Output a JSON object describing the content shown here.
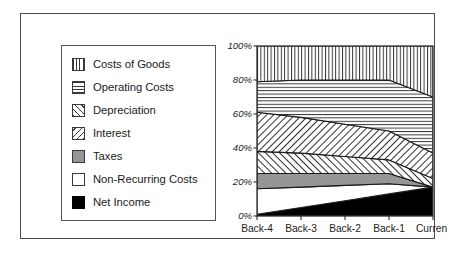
{
  "legend": {
    "items": [
      {
        "label": "Costs of Goods",
        "swatch": "vertical-lines-swatch",
        "color": "#ffffff"
      },
      {
        "label": "Operating Costs",
        "swatch": "horizontal-lines-swatch",
        "color": "#ffffff"
      },
      {
        "label": "Depreciation",
        "swatch": "diagonal-up-hatch-swatch",
        "color": "#ffffff"
      },
      {
        "label": "Interest",
        "swatch": "diagonal-down-hatch-swatch",
        "color": "#ffffff"
      },
      {
        "label": "Taxes",
        "swatch": "solid-gray-swatch",
        "color": "#969696"
      },
      {
        "label": "Non-Recurring Costs",
        "swatch": "solid-white-swatch",
        "color": "#ffffff"
      },
      {
        "label": "Net Income",
        "swatch": "solid-black-swatch",
        "color": "#000000"
      }
    ]
  },
  "axes": {
    "y_ticks": [
      "0%",
      "20%",
      "40%",
      "60%",
      "80%",
      "100%"
    ],
    "x_ticks": [
      "Back-4",
      "Back-3",
      "Back-2",
      "Back-1",
      "Current"
    ]
  },
  "chart_data": {
    "type": "area",
    "title": "",
    "xlabel": "",
    "ylabel": "",
    "stacked": true,
    "normalized_percent": true,
    "grid": false,
    "legend_position": "left",
    "ylim": [
      0,
      100
    ],
    "ytick_values": [
      0,
      20,
      40,
      60,
      80,
      100
    ],
    "categories": [
      "Back-4",
      "Back-3",
      "Back-2",
      "Back-1",
      "Current"
    ],
    "series": [
      {
        "name": "Net Income",
        "fill": "solid-black",
        "values": [
          1,
          5,
          9,
          13,
          17
        ]
      },
      {
        "name": "Non-Recurring Costs",
        "fill": "solid-white",
        "values": [
          15,
          12,
          9,
          6,
          0
        ]
      },
      {
        "name": "Taxes",
        "fill": "solid-gray",
        "values": [
          9,
          8,
          7,
          6,
          0
        ]
      },
      {
        "name": "Interest",
        "fill": "diagonal-down-hatch",
        "values": [
          13,
          12,
          10,
          8,
          5
        ]
      },
      {
        "name": "Depreciation",
        "fill": "diagonal-up-hatch",
        "values": [
          23,
          21,
          19,
          17,
          15
        ]
      },
      {
        "name": "Operating Costs",
        "fill": "horizontal-lines",
        "values": [
          18,
          22,
          26,
          30,
          33
        ]
      },
      {
        "name": "Costs of Goods",
        "fill": "vertical-lines",
        "values": [
          21,
          20,
          20,
          20,
          30
        ]
      }
    ],
    "boundaries_from_bottom": {
      "net_income_top": [
        1,
        5,
        9,
        13,
        17
      ],
      "non_recurring_costs_top": [
        16,
        17,
        18,
        19,
        17
      ],
      "taxes_top": [
        25,
        25,
        25,
        25,
        17
      ],
      "interest_top": [
        38,
        37,
        35,
        33,
        22
      ],
      "depreciation_top": [
        61,
        58,
        54,
        50,
        37
      ],
      "operating_costs_top": [
        79,
        80,
        80,
        80,
        70
      ],
      "costs_of_goods_top": [
        100,
        100,
        100,
        100,
        100
      ]
    }
  }
}
